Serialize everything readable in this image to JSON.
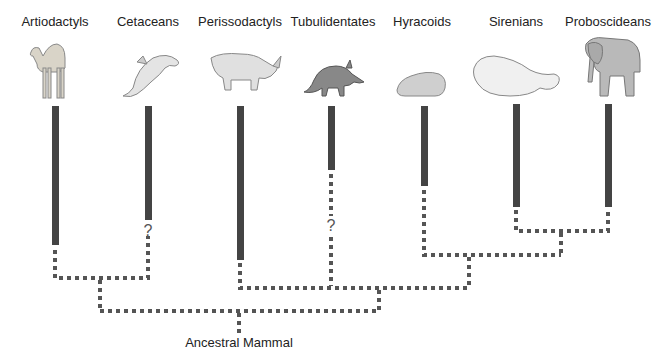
{
  "taxa": [
    {
      "name": "Artiodactyls",
      "animal": "camel-icon",
      "x": 55,
      "bar_bottom": 245
    },
    {
      "name": "Cetaceans",
      "animal": "dolphin-icon",
      "x": 148,
      "bar_bottom": 220,
      "uncertain": "?"
    },
    {
      "name": "Perissodactyls",
      "animal": "rhinoceros-icon",
      "x": 240,
      "bar_bottom": 260
    },
    {
      "name": "Tubulidentates",
      "animal": "aardvark-icon",
      "x": 331,
      "bar_bottom": 170,
      "uncertain": "?"
    },
    {
      "name": "Hyracoids",
      "animal": "hyrax-icon",
      "x": 424,
      "bar_bottom": 186
    },
    {
      "name": "Sirenians",
      "animal": "manatee-icon",
      "x": 516,
      "bar_bottom": 207
    },
    {
      "name": "Proboscideans",
      "animal": "elephant-icon",
      "x": 608,
      "bar_bottom": 207
    }
  ],
  "root": {
    "label": "Ancestral Mammal"
  },
  "colors": {
    "bar": "#444444",
    "dash": "#555555"
  }
}
